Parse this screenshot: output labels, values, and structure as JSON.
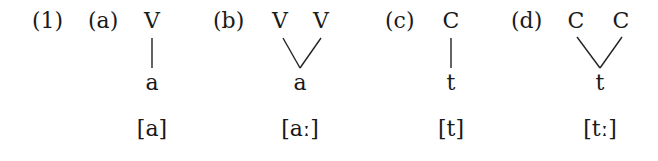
{
  "example_number": "(1)",
  "panels": [
    {
      "label": "(a)",
      "top": [
        "V"
      ],
      "bottom": "a",
      "phonetic": "[a]",
      "association": "single"
    },
    {
      "label": "(b)",
      "top": [
        "V",
        "V"
      ],
      "bottom": "a",
      "phonetic": "[aː]",
      "association": "double"
    },
    {
      "label": "(c)",
      "top": [
        "C"
      ],
      "bottom": "t",
      "phonetic": "[t]",
      "association": "single"
    },
    {
      "label": "(d)",
      "top": [
        "C",
        "C"
      ],
      "bottom": "t",
      "phonetic": "[tː]",
      "association": "double"
    }
  ]
}
